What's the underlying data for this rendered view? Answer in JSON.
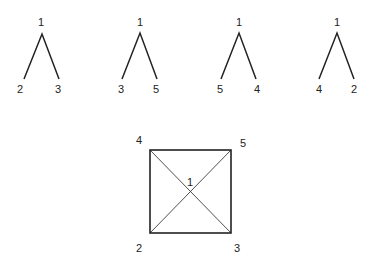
{
  "trees": [
    {
      "root": "1",
      "left": "2",
      "right": "3"
    },
    {
      "root": "1",
      "left": "3",
      "right": "5"
    },
    {
      "root": "1",
      "left": "5",
      "right": "4"
    },
    {
      "root": "1",
      "left": "4",
      "right": "2"
    }
  ],
  "square": {
    "top_left": "4",
    "top_right": "5",
    "bottom_left": "2",
    "bottom_right": "3",
    "center": "1"
  },
  "colors": {
    "line": "#222222",
    "background": "#ffffff"
  }
}
